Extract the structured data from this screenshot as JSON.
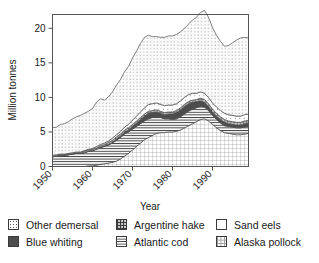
{
  "chart_data": {
    "type": "area",
    "title": "",
    "xlabel": "Year",
    "ylabel": "Million tonnes",
    "xlim": [
      1950,
      1999
    ],
    "ylim": [
      0,
      22
    ],
    "yticks": [
      0,
      5,
      10,
      15,
      20
    ],
    "xticks": [
      1950,
      1960,
      1970,
      1980,
      1990
    ],
    "grid": false,
    "legend_position": "below",
    "stacked": true,
    "stack_order_bottom_to_top": [
      "Alaska pollock",
      "Atlantic cod",
      "Blue whiting",
      "Argentine hake",
      "Sand eels",
      "Other demersal"
    ],
    "x": [
      1950,
      1951,
      1952,
      1953,
      1954,
      1955,
      1956,
      1957,
      1958,
      1959,
      1960,
      1961,
      1962,
      1963,
      1964,
      1965,
      1966,
      1967,
      1968,
      1969,
      1970,
      1971,
      1972,
      1973,
      1974,
      1975,
      1976,
      1977,
      1978,
      1979,
      1980,
      1981,
      1982,
      1983,
      1984,
      1985,
      1986,
      1987,
      1988,
      1989,
      1990,
      1991,
      1992,
      1993,
      1994,
      1995,
      1996,
      1997,
      1998,
      1999
    ],
    "series": [
      {
        "name": "Alaska pollock",
        "pattern": "grid",
        "values": [
          0.0,
          0.0,
          0.0,
          0.0,
          0.0,
          0.0,
          0.0,
          0.0,
          0.0,
          0.1,
          0.1,
          0.2,
          0.3,
          0.4,
          0.5,
          0.6,
          0.8,
          1.1,
          1.5,
          1.9,
          2.4,
          2.9,
          3.4,
          3.9,
          4.2,
          4.5,
          4.8,
          4.9,
          4.9,
          5.0,
          5.0,
          5.1,
          5.3,
          5.6,
          5.9,
          6.2,
          6.5,
          6.8,
          6.9,
          6.6,
          6.1,
          5.6,
          5.2,
          4.9,
          4.8,
          4.7,
          4.6,
          4.6,
          4.7,
          4.8
        ]
      },
      {
        "name": "Atlantic cod",
        "pattern": "horizontal-lines",
        "values": [
          1.4,
          1.5,
          1.6,
          1.6,
          1.7,
          1.8,
          1.9,
          1.9,
          2.0,
          2.1,
          2.2,
          2.3,
          2.4,
          2.5,
          2.6,
          2.8,
          3.0,
          3.1,
          3.2,
          3.1,
          3.0,
          2.9,
          2.8,
          2.7,
          2.7,
          2.6,
          2.4,
          2.2,
          2.0,
          1.9,
          1.8,
          1.8,
          1.9,
          2.0,
          2.1,
          2.1,
          2.0,
          1.9,
          1.7,
          1.5,
          1.3,
          1.2,
          1.1,
          1.0,
          1.0,
          1.0,
          1.0,
          1.0,
          1.0,
          1.0
        ]
      },
      {
        "name": "Blue whiting",
        "pattern": "solid-dark",
        "values": [
          0.0,
          0.0,
          0.0,
          0.0,
          0.0,
          0.0,
          0.0,
          0.0,
          0.0,
          0.0,
          0.0,
          0.0,
          0.1,
          0.1,
          0.1,
          0.1,
          0.2,
          0.2,
          0.3,
          0.3,
          0.4,
          0.5,
          0.6,
          0.7,
          0.8,
          0.7,
          0.7,
          0.6,
          0.6,
          0.7,
          0.8,
          0.9,
          1.0,
          1.1,
          1.1,
          1.0,
          0.9,
          0.8,
          0.7,
          0.6,
          0.5,
          0.5,
          0.5,
          0.5,
          0.4,
          0.4,
          0.4,
          0.4,
          0.5,
          0.5
        ]
      },
      {
        "name": "Argentine hake",
        "pattern": "crosshatch",
        "values": [
          0.1,
          0.1,
          0.1,
          0.1,
          0.1,
          0.1,
          0.1,
          0.1,
          0.2,
          0.2,
          0.2,
          0.2,
          0.2,
          0.2,
          0.3,
          0.3,
          0.3,
          0.3,
          0.3,
          0.3,
          0.3,
          0.3,
          0.3,
          0.3,
          0.3,
          0.3,
          0.3,
          0.3,
          0.3,
          0.3,
          0.3,
          0.3,
          0.3,
          0.3,
          0.3,
          0.3,
          0.3,
          0.4,
          0.4,
          0.4,
          0.4,
          0.4,
          0.4,
          0.4,
          0.4,
          0.4,
          0.4,
          0.4,
          0.4,
          0.4
        ]
      },
      {
        "name": "Sand eels",
        "pattern": "sparse-dots",
        "values": [
          0.1,
          0.1,
          0.1,
          0.1,
          0.1,
          0.1,
          0.1,
          0.1,
          0.1,
          0.1,
          0.1,
          0.2,
          0.2,
          0.2,
          0.2,
          0.3,
          0.3,
          0.4,
          0.4,
          0.5,
          0.6,
          0.7,
          0.8,
          0.9,
          1.0,
          1.0,
          1.0,
          1.0,
          1.0,
          1.0,
          1.0,
          1.0,
          1.0,
          1.0,
          1.0,
          1.0,
          0.9,
          0.9,
          0.9,
          0.9,
          0.9,
          0.9,
          0.9,
          0.9,
          0.9,
          0.9,
          0.9,
          0.9,
          0.9,
          0.9
        ]
      },
      {
        "name": "Other demersal",
        "pattern": "fine-dots",
        "values": [
          4.0,
          4.0,
          4.3,
          4.4,
          4.6,
          4.9,
          5.1,
          5.3,
          5.4,
          5.5,
          5.8,
          6.4,
          6.6,
          6.2,
          6.4,
          6.7,
          7.2,
          7.5,
          8.0,
          8.4,
          9.0,
          9.4,
          9.9,
          10.2,
          10.0,
          9.7,
          9.6,
          9.7,
          9.9,
          10.0,
          10.0,
          10.0,
          10.0,
          10.0,
          10.2,
          10.6,
          11.0,
          11.5,
          12.0,
          11.6,
          10.9,
          10.4,
          10.0,
          9.7,
          10.0,
          10.5,
          11.0,
          11.3,
          11.2,
          11.0
        ]
      }
    ],
    "total_top_values": [
      5.6,
      5.7,
      6.1,
      6.2,
      6.5,
      6.9,
      7.2,
      7.4,
      7.7,
      8.0,
      8.4,
      9.3,
      9.8,
      9.6,
      10.1,
      10.8,
      11.8,
      12.6,
      13.7,
      14.5,
      15.7,
      16.7,
      17.8,
      18.7,
      19.0,
      18.8,
      18.8,
      18.7,
      18.7,
      18.9,
      18.9,
      19.1,
      19.5,
      20.0,
      20.6,
      21.2,
      21.6,
      21.3,
      20.6,
      19.6,
      18.1,
      17.0,
      16.1,
      15.4,
      15.5,
      15.9,
      16.3,
      16.6,
      16.7,
      16.6
    ]
  },
  "axes": {
    "ylabel": "Million tonnes",
    "xlabel": "Year",
    "yticks": [
      "0",
      "5",
      "10",
      "15",
      "20"
    ],
    "xticks": [
      "1950",
      "1960",
      "1970",
      "1980",
      "1990"
    ]
  },
  "legend": {
    "entries": [
      {
        "label": "Other demersal",
        "pattern": "fine-dots",
        "row": 0,
        "col": 0
      },
      {
        "label": "Argentine hake",
        "pattern": "crosshatch",
        "row": 0,
        "col": 1
      },
      {
        "label": "Sand eels",
        "pattern": "sparse-dots",
        "row": 0,
        "col": 2
      },
      {
        "label": "Blue whiting",
        "pattern": "solid-dark",
        "row": 1,
        "col": 0
      },
      {
        "label": "Atlantic cod",
        "pattern": "horizontal-lines",
        "row": 1,
        "col": 1
      },
      {
        "label": "Alaska pollock",
        "pattern": "grid",
        "row": 1,
        "col": 2
      }
    ]
  },
  "colors": {
    "axis": "#555555",
    "outline": "#4a4a4a",
    "text": "#1a1a1a",
    "background": "#ffffff"
  }
}
